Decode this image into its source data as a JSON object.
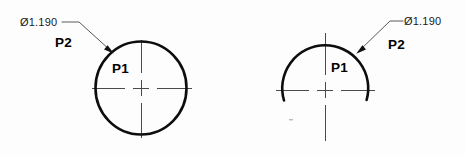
{
  "drawing": {
    "title": "Engineering dimension callout comparison",
    "background_color": "#fdfdfd",
    "line_color": "#0d0d0d",
    "centerline_color": "#4a4a4a",
    "leader_color": "#5a5a5a"
  },
  "figures": [
    {
      "id": "left",
      "shape": "full-circle",
      "dimension_text": "Ø1.190",
      "point_inner_label": "P1",
      "point_leader_label": "P2",
      "center": {
        "x": 141,
        "y": 88
      },
      "radius": 46,
      "arc_start_deg": 0,
      "arc_end_deg": 360
    },
    {
      "id": "right",
      "shape": "arc",
      "dimension_text": "Ø1.190",
      "point_inner_label": "P1",
      "point_leader_label": "P2",
      "center": {
        "x": 325,
        "y": 90
      },
      "radius": 43,
      "arc_start_deg": 192,
      "arc_end_deg": 348
    }
  ],
  "labels": {
    "left_dimension": "Ø1.190",
    "left_p2": "P2",
    "left_p1": "P1",
    "right_dimension": "Ø1.190",
    "right_p2": "P2",
    "right_p1": "P1"
  }
}
